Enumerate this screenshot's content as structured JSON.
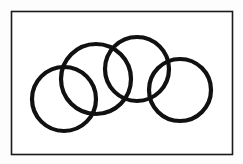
{
  "figure": {
    "title": "Four overlapping circles in a chain arrangement",
    "background_color": "#fdfdfd",
    "canvas": {
      "width": 243,
      "height": 164
    },
    "frame": {
      "name": "outer-border",
      "x": 11.5,
      "y": 11.5,
      "width": 221,
      "height": 143,
      "stroke_color": "#1a1a1a",
      "stroke_width": 1.6,
      "fill_color": "#ffffff"
    },
    "stroke_color": "#111111",
    "stroke_width": 4.2,
    "circle_count": 4,
    "circles": [
      {
        "id": "circle-1",
        "label": "Left circle",
        "cx": 64,
        "cy": 99,
        "r": 32,
        "stroke_color": "#111111",
        "stroke_width": 4.2
      },
      {
        "id": "circle-2",
        "label": "Second circle",
        "cx": 96,
        "cy": 79,
        "r": 35,
        "stroke_color": "#111111",
        "stroke_width": 4.2
      },
      {
        "id": "circle-3",
        "label": "Third circle",
        "cx": 137,
        "cy": 69,
        "r": 32,
        "stroke_color": "#111111",
        "stroke_width": 4.2
      },
      {
        "id": "circle-4",
        "label": "Right circle",
        "cx": 180,
        "cy": 90,
        "r": 31,
        "stroke_color": "#111111",
        "stroke_width": 4.2
      }
    ]
  }
}
